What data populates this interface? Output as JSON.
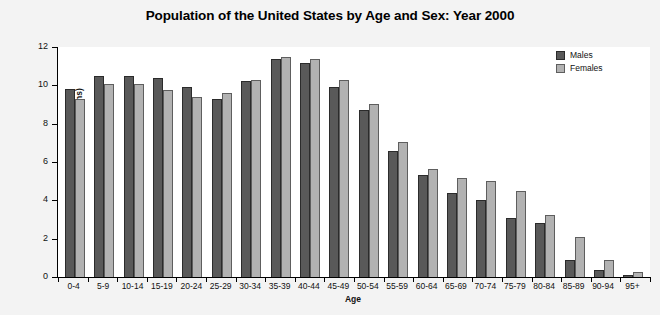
{
  "chart_data": {
    "type": "bar",
    "title": "Population of the United States by Age and Sex: Year 2000",
    "xlabel": "Age",
    "ylabel": "Population (Millions)",
    "ylim": [
      0,
      12
    ],
    "yticks": [
      0,
      2,
      4,
      6,
      8,
      10,
      12
    ],
    "grid": false,
    "legend_position": "top-right",
    "categories": [
      "0-4",
      "5-9",
      "10-14",
      "15-19",
      "20-24",
      "25-29",
      "30-34",
      "35-39",
      "40-44",
      "45-49",
      "50-54",
      "55-59",
      "60-64",
      "65-69",
      "70-74",
      "75-79",
      "80-84",
      "85-89",
      "90-94",
      "95+"
    ],
    "series": [
      {
        "name": "Males",
        "color": "#595959",
        "values": [
          9.8,
          10.5,
          10.5,
          10.4,
          9.9,
          9.3,
          10.25,
          11.35,
          11.15,
          9.9,
          8.7,
          6.6,
          5.3,
          4.4,
          4.0,
          3.1,
          2.8,
          0.9,
          0.35,
          0.1
        ]
      },
      {
        "name": "Females",
        "color": "#b2b2b2",
        "values": [
          9.3,
          10.05,
          10.05,
          9.75,
          9.4,
          9.6,
          10.3,
          11.5,
          11.4,
          10.3,
          9.05,
          7.05,
          5.65,
          5.15,
          5.0,
          4.5,
          3.25,
          2.1,
          0.9,
          0.25
        ]
      }
    ]
  },
  "legend": {
    "items": [
      {
        "label": "Males",
        "swatch": "male-swatch"
      },
      {
        "label": "Females",
        "swatch": "female-swatch"
      }
    ]
  }
}
